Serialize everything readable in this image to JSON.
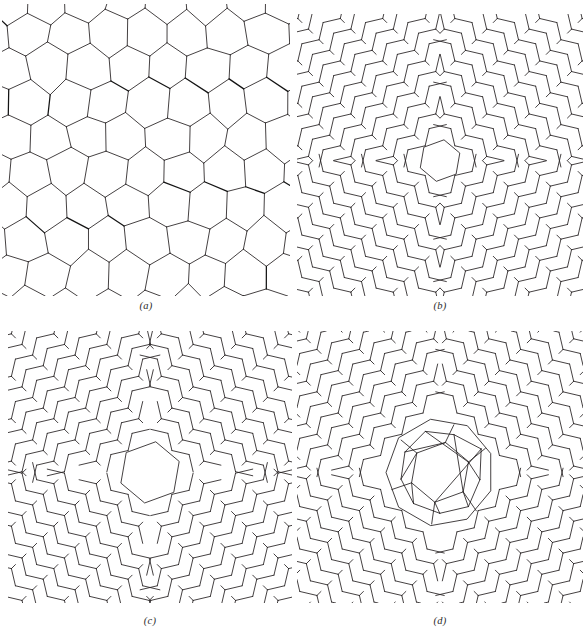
{
  "figure": {
    "kind": "scientific-figure",
    "background_color": "#ffffff",
    "line_color": "#231f20",
    "panel_count": 4
  },
  "panels": [
    {
      "id": "a",
      "label": "(a)",
      "structure_type": "continuous-random-network",
      "description": "Three-coordinated random network of irregular polygons (pentagons, hexagons, heptagons) with dangling bonds at the border",
      "ring_sizes": [
        5,
        6,
        7
      ],
      "coordination": 3,
      "has_central_defect": false
    },
    {
      "id": "b",
      "label": "(b)",
      "structure_type": "pinwheel-disclination",
      "description": "Four domains of parallel zigzag chains of rhombi meeting at a central pinwheel core; smallest core",
      "domain_count": 4,
      "coordination": 3,
      "has_central_defect": true,
      "core_size": "small"
    },
    {
      "id": "c",
      "label": "(c)",
      "structure_type": "pinwheel-disclination",
      "description": "Same pinwheel motif as (b) with an enlarged open central cell",
      "domain_count": 4,
      "coordination": 3,
      "has_central_defect": true,
      "core_size": "medium"
    },
    {
      "id": "d",
      "label": "(d)",
      "structure_type": "pinwheel-disclination-with-amorphous-core",
      "description": "Pinwheel arrangement surrounding a large amorphous cluster of pentagons and hexagons at the core",
      "domain_count": 4,
      "coordination": 3,
      "has_central_defect": true,
      "core_size": "large"
    }
  ],
  "chart_data": {
    "type": "diagram",
    "title": "",
    "subtitle": "",
    "panels": [
      "(a)",
      "(b)",
      "(c)",
      "(d)"
    ],
    "legend": [],
    "grid": false,
    "axes": false
  }
}
